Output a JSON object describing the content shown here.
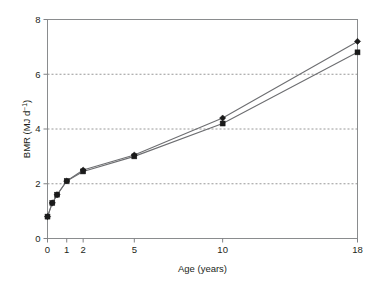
{
  "chart_data": {
    "type": "line",
    "title": "",
    "subtitle": "",
    "xlabel": "Age (years)",
    "ylabel": "BMR (MJ d⁻¹)",
    "ylabel_parts": {
      "main": "BMR (MJ d",
      "superscript": "−1",
      "tail": ")"
    },
    "xlim": [
      0,
      18
    ],
    "ylim": [
      0,
      8
    ],
    "x_scale": "non-linear (categorical-spaced age groups)",
    "x_ticks": [
      0,
      1,
      2,
      5,
      10,
      18
    ],
    "x_tick_labels": [
      "0",
      "1",
      "2",
      "5",
      "10",
      "18"
    ],
    "y_ticks": [
      0,
      2,
      4,
      6,
      8
    ],
    "y_tick_labels": [
      "0",
      "2",
      "4",
      "6",
      "8"
    ],
    "grid": true,
    "grid_axis": "y",
    "grid_style": "dashed",
    "grid_values": [
      2,
      4,
      6
    ],
    "legend": false,
    "legend_position": "none",
    "frame": "box",
    "x": [
      0,
      0.25,
      0.5,
      1,
      2,
      5,
      10,
      18
    ],
    "series": [
      {
        "name": "Boys",
        "marker": "diamond",
        "values": [
          0.8,
          1.3,
          1.6,
          2.1,
          2.5,
          3.05,
          4.4,
          7.2
        ]
      },
      {
        "name": "Girls",
        "marker": "square",
        "values": [
          0.8,
          1.3,
          1.6,
          2.1,
          2.45,
          3.0,
          4.2,
          6.8
        ]
      }
    ],
    "colors": {
      "line": "#6d6e71",
      "marker": "#1a1a1a",
      "grid": "#8c8c8c",
      "axis": "#808285",
      "text": "#231f20",
      "background": "#ffffff"
    }
  }
}
